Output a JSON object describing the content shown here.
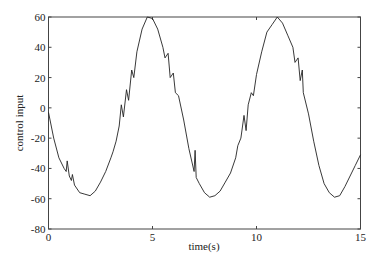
{
  "chart_data": {
    "type": "line",
    "title": "",
    "xlabel": "time(s)",
    "ylabel": "control input",
    "xlim": [
      0,
      15
    ],
    "ylim": [
      -80,
      60
    ],
    "xticks": [
      0,
      5,
      10,
      15
    ],
    "yticks": [
      60,
      40,
      20,
      0,
      -20,
      -40,
      -60,
      -80
    ],
    "grid": false,
    "legend": null,
    "series": [
      {
        "name": "control input",
        "color": "#222222",
        "x": [
          0,
          0.25,
          0.5,
          0.75,
          0.85,
          0.9,
          1.0,
          1.1,
          1.15,
          1.25,
          1.5,
          1.75,
          2.0,
          2.25,
          2.5,
          2.75,
          3.0,
          3.1,
          3.25,
          3.4,
          3.5,
          3.6,
          3.75,
          3.85,
          4.0,
          4.1,
          4.25,
          4.5,
          4.75,
          5.0,
          5.25,
          5.5,
          5.6,
          5.75,
          5.85,
          6.0,
          6.1,
          6.25,
          6.5,
          6.75,
          7.0,
          7.05,
          7.1,
          7.25,
          7.5,
          7.75,
          8.0,
          8.25,
          8.5,
          8.75,
          9.0,
          9.1,
          9.25,
          9.4,
          9.5,
          9.6,
          9.75,
          9.85,
          10.0,
          10.25,
          10.5,
          10.75,
          11.0,
          11.25,
          11.5,
          11.75,
          11.85,
          12.0,
          12.1,
          12.2,
          12.25,
          12.5,
          12.75,
          13.0,
          13.25,
          13.5,
          13.75,
          14.0,
          14.25,
          14.5,
          14.75,
          15.0
        ],
        "y": [
          -3,
          -20,
          -33,
          -40,
          -42,
          -35,
          -45,
          -48,
          -44,
          -51,
          -56,
          -57,
          -58,
          -55,
          -49,
          -42,
          -33,
          -29,
          -22,
          -12,
          2,
          -6,
          12,
          5,
          25,
          20,
          37,
          52,
          60,
          59,
          52,
          40,
          33,
          36,
          20,
          23,
          10,
          8,
          -8,
          -27,
          -42,
          -28,
          -46,
          -50,
          -56,
          -59,
          -58,
          -55,
          -49,
          -43,
          -33,
          -25,
          -20,
          -5,
          -15,
          2,
          10,
          8,
          22,
          37,
          50,
          55,
          60,
          56,
          48,
          40,
          30,
          33,
          18,
          25,
          10,
          -4,
          -22,
          -38,
          -50,
          -56,
          -59,
          -58,
          -52,
          -45,
          -38,
          -31
        ]
      }
    ]
  }
}
